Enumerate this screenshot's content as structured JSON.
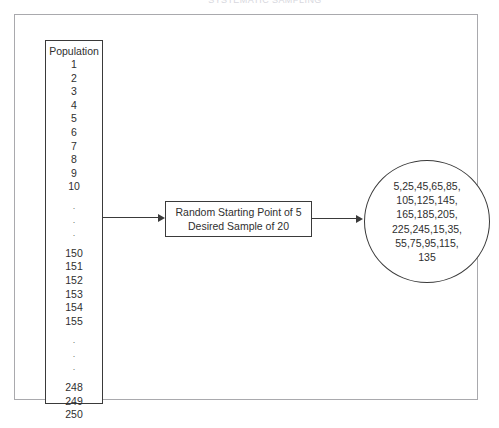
{
  "page": {
    "top_caption": "SYSTEMATIC SAMPLING"
  },
  "population": {
    "title": "Population",
    "items": [
      "1",
      "2",
      "3",
      "4",
      "5",
      "6",
      "7",
      "8",
      "9",
      "10",
      ".",
      ".",
      ".",
      "150",
      "151",
      "152",
      "153",
      "154",
      "155",
      ".",
      ".",
      ".",
      "248",
      "249",
      "250"
    ]
  },
  "process": {
    "line1": "Random Starting Point of 5",
    "line2": "Desired Sample of 20"
  },
  "result": {
    "lines": [
      "5,25,45,65,85,",
      "105,125,145,",
      "165,185,205,",
      "225,245,15,35,",
      "55,75,95,115,",
      "135"
    ]
  },
  "arrows": {
    "population_to_process": "arrow-right",
    "process_to_result": "arrow-right"
  },
  "colors": {
    "stroke": "#3a3a3a",
    "frame": "#a9a9ad",
    "text": "#2f2f2f",
    "background": "#ffffff"
  }
}
